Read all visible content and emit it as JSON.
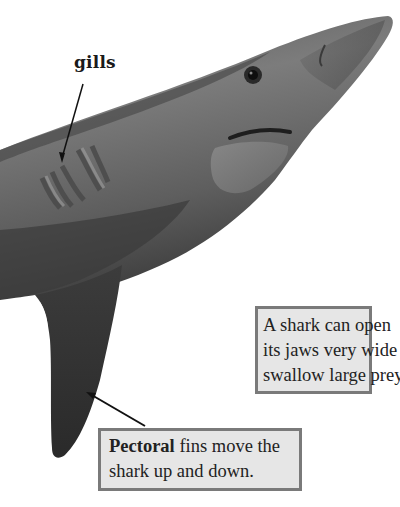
{
  "figure": {
    "colors": {
      "background": "#ffffff",
      "callout_fill": "#e6e6e6",
      "callout_border": "#7a7a7a",
      "text": "#222222",
      "shark_dark": "#2e2e2e",
      "shark_mid": "#6a6a6a",
      "shark_light": "#9a9a9a"
    }
  },
  "labels": {
    "gills": "gills"
  },
  "callouts": {
    "jaws": {
      "lines": [
        "A shark can open",
        "its jaws very wide to",
        "swallow large prey."
      ]
    },
    "fins": {
      "bold_term": "Pectoral",
      "line1_rest": " fins move the",
      "line2": "shark up and down."
    }
  }
}
